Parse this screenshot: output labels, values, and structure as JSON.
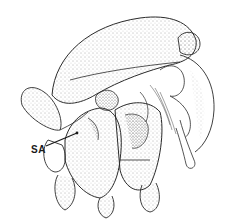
{
  "figure": {
    "labels": [
      {
        "text": "SA",
        "x": 31,
        "y": 144
      }
    ]
  },
  "colors": {
    "line": "#2a2a2a",
    "stipple": "#555555",
    "background": "#ffffff"
  }
}
